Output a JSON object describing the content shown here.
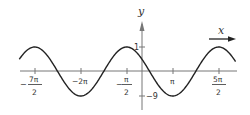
{
  "chart_data": {
    "type": "line",
    "title": "",
    "xlabel": "x",
    "ylabel": "y",
    "function_description": "cosine-shaped wave with period 3π; maxima at x = -7π/2, -π/2, 5π/2; minima at x = -2π, π",
    "period": "3π",
    "x_ticks": [
      {
        "value": -3.5,
        "label_num": "7π",
        "label_den": "2",
        "sign": "−",
        "fraction": true
      },
      {
        "value": -2.0,
        "label": "−2π",
        "fraction": false
      },
      {
        "value": -0.5,
        "label_num": "π",
        "label_den": "2",
        "sign": "−",
        "fraction": true
      },
      {
        "value": 1.0,
        "label": "π",
        "fraction": false
      },
      {
        "value": 2.5,
        "label_num": "5π",
        "label_den": "2",
        "sign": "",
        "fraction": true
      }
    ],
    "y_ticks": [
      {
        "value": 1,
        "label": "1"
      },
      {
        "value": -9,
        "label": "−9"
      }
    ],
    "x_units": "multiples of π",
    "x_range_pi": [
      -4.0,
      3.05
    ],
    "max_value": 1,
    "min_value": -9,
    "extrema": [
      {
        "x_pi": -3.5,
        "y": 1,
        "kind": "max"
      },
      {
        "x_pi": -2.0,
        "y": -9,
        "kind": "min"
      },
      {
        "x_pi": -0.5,
        "y": 1,
        "kind": "max"
      },
      {
        "x_pi": 1.0,
        "y": -9,
        "kind": "min"
      },
      {
        "x_pi": 2.5,
        "y": 1,
        "kind": "max"
      }
    ],
    "grid": false,
    "legend": null,
    "colors": {
      "curve": "#222222",
      "axes": "#777777",
      "text": "#333333"
    }
  },
  "labels": {
    "y_axis": "y",
    "x_axis": "x",
    "tick_m7pi2_sign": "−",
    "tick_m7pi2_num": "7π",
    "tick_m7pi2_den": "2",
    "tick_m2pi": "−2π",
    "tick_mpi2_sign": "−",
    "tick_mpi2_num": "π",
    "tick_mpi2_den": "2",
    "tick_pi": "π",
    "tick_5pi2_num": "5π",
    "tick_5pi2_den": "2",
    "y_tick_1": "1",
    "y_tick_m9": "−9"
  }
}
